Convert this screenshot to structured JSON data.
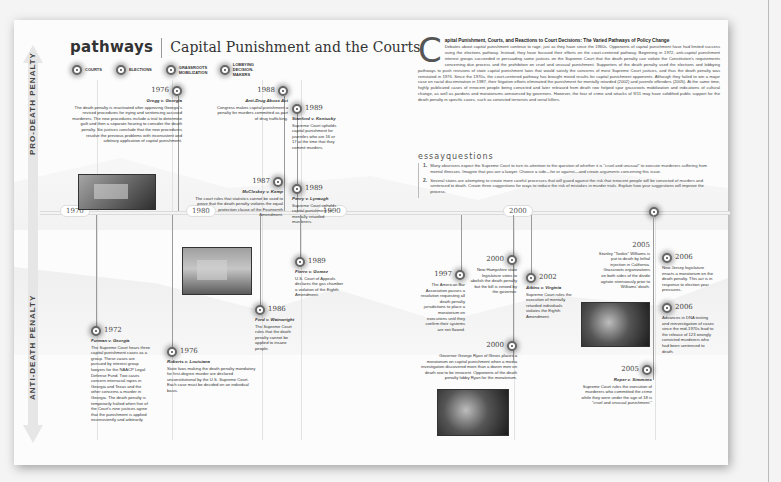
{
  "header": {
    "brand": "pathways",
    "title": "Capital Punishment and the Courts"
  },
  "legend": [
    {
      "label": "Courts",
      "icon": "courts-dot-icon"
    },
    {
      "label": "Elections",
      "icon": "elections-dot-icon"
    },
    {
      "label": "Grassroots Mobilization",
      "icon": "grassroots-dot-icon"
    },
    {
      "label": "Lobbying Decision-Makers",
      "icon": "lobbying-dot-icon"
    }
  ],
  "axis": {
    "pro": "PRO-DEATH PENALTY",
    "anti": "ANTI-DEATH PENALTY"
  },
  "timeline": {
    "ticks": [
      "1970",
      "1980",
      "1990",
      "2000"
    ]
  },
  "events_pro": [
    {
      "year": "1976",
      "case": "Gregg v. Georgia",
      "text": "The death penalty is reactivated after approving Georgia's revised procedures for trying and sentencing accused murderers. The new procedures include a trial to determine guilt and then a separate hearing to consider the death penalty. Six justices conclude that the new procedures resolve the previous problems with inconsistent and arbitrary application of capital punishment."
    },
    {
      "year": "1988",
      "case": "Anti-Drug Abuse Act",
      "text": "Congress makes capital punishment a penalty for murders committed as part of drug trafficking."
    },
    {
      "year": "1989",
      "case": "Stanford v. Kentucky",
      "text": "Supreme Court upholds capital punishment for juveniles who are 16 or 17 at the time that they commit murders."
    },
    {
      "year": "1987",
      "case": "McCleskey v. Kemp",
      "text": "The court rules that statistics cannot be used to prove that the death penalty violates the equal protection clause of the Fourteenth Amendment."
    },
    {
      "year": "1989",
      "case": "Penry v. Lynaugh",
      "text": "Supreme Court upholds capital punishment for mentally retarded murderers."
    }
  ],
  "events_anti": [
    {
      "year": "1972",
      "case": "Furman v. Georgia",
      "text": "The Supreme Court hears three capital punishment cases as a group. These cases are pursued by interest group lawyers for the NAACP Legal Defense Fund. Two cases concern interracial rapes in Georgia and Texas and the other concerns a murder in Georgia. The death penalty is temporarily halted when five of the Court's nine justices agree that the punishment is applied inconsistently and arbitrarily."
    },
    {
      "year": "1976",
      "case": "Roberts v. Louisiana",
      "text": "State laws making the death penalty mandatory for first-degree murder are declared unconstitutional by the U.S. Supreme Court. Each case must be decided on an individual basis."
    },
    {
      "year": "1989",
      "case": "Fierro v. Gomez",
      "text": "U.S. Court of Appeals declares the gas chamber a violation of the Eighth Amendment."
    },
    {
      "year": "1986",
      "case": "Ford v. Wainwright",
      "text": "The Supreme Court rules that the death penalty cannot be applied to insane people."
    },
    {
      "year": "1997",
      "case": "",
      "text": "The American Bar Association passes a resolution requesting all death penalty jurisdictions to place a moratorium on executions until they confirm their systems are not flawed."
    },
    {
      "year": "2000",
      "case": "",
      "text": "New Hampshire state legislature votes to abolish the death penalty but the bill is vetoed by the governor."
    },
    {
      "year": "2002",
      "case": "Atkins v. Virginia",
      "text": "Supreme Court rules the execution of mentally retarded individuals violates the Eighth Amendment."
    },
    {
      "year": "2000",
      "case": "",
      "text": "Governor George Ryan of Illinois places a moratorium on capital punishment when a media investigation discovered more than a dozen men on death row to be innocent. Opponents of the death penalty lobby Ryan for the moratorium."
    },
    {
      "year": "2005",
      "case": "",
      "text": "Stanley \"Tookie\" Williams is put to death by lethal injection in California. Grassroots organizations on both sides of the divide agitate strenuously prior to Williams' death."
    },
    {
      "year": "2005",
      "case": "Roper v. Simmons",
      "text": "Supreme Court rules the execution of murderers who committed the crime while they were under the age of 18 is \"cruel and unusual punishment.\""
    },
    {
      "year": "2006",
      "case": "",
      "text": "New Jersey legislature enacts a moratorium on the death penalty. This act is in response to election year pressures."
    },
    {
      "year": "2006",
      "case": "",
      "text": "Advances in DNA testing and reinvestigation of cases since the mid-1970s lead to the release of 123 wrongly convicted murderers who had been sentenced to death."
    }
  ],
  "essay": {
    "dropcap": "C",
    "heading": "apital Punishment, Courts, and Reactions to Court Decisions: The Varied Pathways of Policy Change",
    "body": "Debates about capital punishment continue to rage, just as they have since the 1960s. Opponents of capital punishment have had limited success using the elections pathway. Instead, they have focused their efforts on the court-centered pathway. Beginning in 1972, anti-capital punishment interest groups succeeded in persuading some justices on the Supreme Court that the death penalty can violate the Constitution's requirements concerning due process and the prohibition on cruel and unusual punishment. Supporters of the death penalty used the elections and lobbying pathways to push revisions of state capital punishment laws that would satisfy the concerns of most Supreme Court justices, and thus the death penalty was reinstated in 1976. Since the 1970s, the court-centered pathway has brought mixed results for capital punishment opponents. Although they failed to win a major case on racial discrimination in 1987, their litigation efforts eliminated the punishment for mentally retarded (2002) and juvenile offenders (2005). At the same time, highly publicized cases of innocent people being convicted and later released from death row helped spur grassroots mobilization and indications of cultural change, as well as pardons and moratoriums announced by governors. However, the fear of crime and attacks of 9/11 may have solidified public support for the death penalty in specific cases, such as convicted terrorists and serial killers."
  },
  "essay_questions": {
    "title": "essayquestions",
    "items": [
      {
        "num": "1.",
        "text": "Many observers expect the Supreme Court to turn its attention to the question of whether it is \"cruel and unusual\" to execute murderers suffering from mental illnesses. Imagine that you are a lawyer. Choose a side—for or against—and create arguments concerning this issue."
      },
      {
        "num": "2.",
        "text": "Several states are attempting to create more careful processes that will guard against the risk that innocent people will be convicted of murders and sentenced to death. Create three suggestions for ways to reduce the risk of mistakes in murder trials. Explain how your suggestions will improve the process."
      }
    ]
  }
}
